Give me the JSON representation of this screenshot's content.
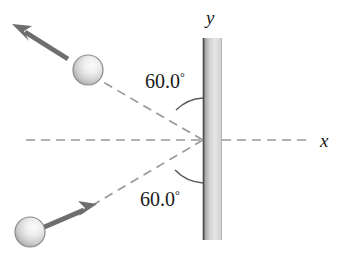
{
  "figure": {
    "background_color": "#ffffff"
  },
  "axes": {
    "y_label": "y",
    "x_label": "x",
    "axis_color": "#8c8c8c"
  },
  "wall": {
    "name": "vertical-wall",
    "edge_color": "#4a4a4a",
    "fill_light": "#f2f2f2",
    "fill_dark": "#9a9a9a"
  },
  "angles": [
    {
      "id": "incoming-angle",
      "value": "60.0",
      "degree_symbol": "°",
      "label": "60.0°"
    },
    {
      "id": "outgoing-angle",
      "value": "60.0",
      "degree_symbol": "°",
      "label": "60.0°"
    }
  ],
  "balls": [
    {
      "id": "ball-outgoing",
      "fill_light": "#f0f0f0",
      "fill_dark": "#a8a8a8",
      "outline": "#8a8a8a"
    },
    {
      "id": "ball-incoming",
      "fill_light": "#f0f0f0",
      "fill_dark": "#a8a8a8",
      "outline": "#8a8a8a"
    }
  ],
  "arrows": [
    {
      "id": "velocity-arrow-outgoing",
      "direction": "up-left",
      "color": "#6e6e6e"
    },
    {
      "id": "velocity-arrow-incoming",
      "direction": "up-right",
      "color": "#6e6e6e"
    }
  ],
  "trajectories": [
    {
      "id": "trajectory-outgoing",
      "style": "dashed",
      "color": "#9a9a9a"
    },
    {
      "id": "trajectory-incoming",
      "style": "dashed",
      "color": "#9a9a9a"
    }
  ],
  "arcs": [
    {
      "id": "angle-arc-top",
      "color": "#5a5a5a"
    },
    {
      "id": "angle-arc-bottom",
      "color": "#5a5a5a"
    }
  ]
}
